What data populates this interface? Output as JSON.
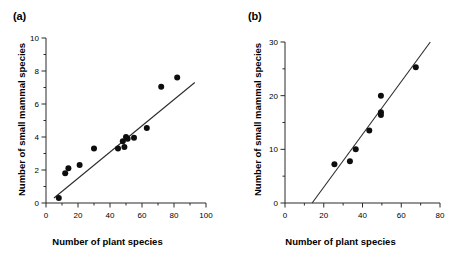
{
  "figure": {
    "panels": [
      {
        "id": "a",
        "label": "(a)",
        "chart_data": {
          "type": "scatter",
          "title": "",
          "xlabel": "Number of plant species",
          "ylabel": "Number of small mammal species",
          "xlim": [
            0,
            100
          ],
          "ylim": [
            0,
            10
          ],
          "xticks": [
            0,
            20,
            40,
            60,
            80,
            100
          ],
          "yticks": [
            0,
            2,
            4,
            6,
            8,
            10
          ],
          "xminor_step": 10,
          "yminor_step": 1,
          "grid": false,
          "legend": "none",
          "points": [
            {
              "x": 8,
              "y": 0.3
            },
            {
              "x": 12,
              "y": 1.8
            },
            {
              "x": 14,
              "y": 2.1
            },
            {
              "x": 21,
              "y": 2.3
            },
            {
              "x": 30,
              "y": 3.3
            },
            {
              "x": 45,
              "y": 3.3
            },
            {
              "x": 48,
              "y": 3.75
            },
            {
              "x": 49,
              "y": 3.4
            },
            {
              "x": 50,
              "y": 4.0
            },
            {
              "x": 51,
              "y": 3.9
            },
            {
              "x": 55,
              "y": 3.95
            },
            {
              "x": 63,
              "y": 4.55
            },
            {
              "x": 72,
              "y": 7.05
            },
            {
              "x": 82,
              "y": 7.6
            }
          ],
          "trendline": {
            "x0": 5,
            "y0": 0.3,
            "x1": 93,
            "y1": 7.3
          }
        }
      },
      {
        "id": "b",
        "label": "(b)",
        "chart_data": {
          "type": "scatter",
          "title": "",
          "xlabel": "Number of plant species",
          "ylabel": "Number of small mammal species",
          "xlim": [
            0,
            80
          ],
          "ylim": [
            0,
            30
          ],
          "xticks": [
            0,
            20,
            40,
            60,
            80
          ],
          "yticks": [
            0,
            10,
            20,
            30
          ],
          "xminor_step": 10,
          "yminor_step": 5,
          "grid": false,
          "legend": "none",
          "points": [
            {
              "x": 25.5,
              "y": 7.2
            },
            {
              "x": 33.5,
              "y": 7.8
            },
            {
              "x": 36.5,
              "y": 10.0
            },
            {
              "x": 43.5,
              "y": 13.5
            },
            {
              "x": 49.5,
              "y": 16.4
            },
            {
              "x": 49.5,
              "y": 16.9
            },
            {
              "x": 49.5,
              "y": 20.0
            },
            {
              "x": 67.5,
              "y": 25.3
            }
          ],
          "trendline": {
            "x0": 14,
            "y0": 0,
            "x1": 75,
            "y1": 30
          }
        }
      }
    ]
  }
}
